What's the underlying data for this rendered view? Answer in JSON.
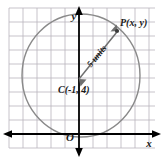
{
  "figure": {
    "axis_labels": {
      "x": "x",
      "y": "y",
      "origin": "O"
    },
    "points": [
      {
        "id": "P",
        "label": "P(x, y)",
        "role": "point-on-circle"
      },
      {
        "id": "C",
        "label": "C(-1, 4)",
        "role": "circle-center"
      }
    ],
    "radius": {
      "label": "5 units",
      "value": 5,
      "units": "units"
    },
    "colors": {
      "grid": "#b9b4bd",
      "axis": "#000000",
      "circle": "#8a8a8a",
      "radius_arrow": "#6f6f6f",
      "text": "#1a1a1a",
      "background": "#ffffff"
    }
  }
}
